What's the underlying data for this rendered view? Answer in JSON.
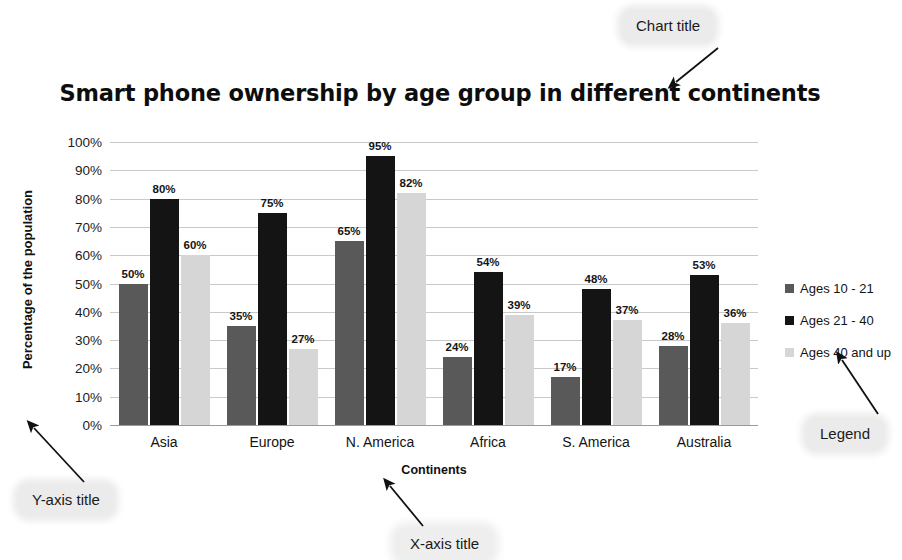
{
  "chart_data": {
    "type": "bar",
    "title": "Smart phone ownership by age group in different continents",
    "xlabel": "Continents",
    "ylabel": "Percentage of the population",
    "categories": [
      "Asia",
      "Europe",
      "N. America",
      "Africa",
      "S. America",
      "Australia"
    ],
    "series": [
      {
        "name": "Ages 10 - 21",
        "color": "#595959",
        "values": [
          50,
          35,
          65,
          24,
          17,
          28
        ],
        "labels": [
          "50%",
          "35%",
          "65%",
          "24%",
          "17%",
          "28%"
        ]
      },
      {
        "name": "Ages 21 - 40",
        "color": "#141414",
        "values": [
          80,
          75,
          95,
          54,
          48,
          53
        ],
        "labels": [
          "80%",
          "75%",
          "95%",
          "54%",
          "48%",
          "53%"
        ]
      },
      {
        "name": "Ages 40 and up",
        "color": "#d6d6d6",
        "values": [
          60,
          27,
          82,
          39,
          37,
          36
        ],
        "labels": [
          "60%",
          "27%",
          "82%",
          "39%",
          "37%",
          "36%"
        ]
      }
    ],
    "ylim": [
      0,
      100
    ],
    "ytick_labels": [
      "100%",
      "90%",
      "80%",
      "70%",
      "60%",
      "50%",
      "40%",
      "30%",
      "20%",
      "10%",
      "0%"
    ],
    "ytick_values": [
      100,
      90,
      80,
      70,
      60,
      50,
      40,
      30,
      20,
      10,
      0
    ],
    "grid": true,
    "legend_position": "right",
    "unit_suffix": "%"
  },
  "annotations": {
    "chart_title": "Chart title",
    "y_axis_title": "Y-axis title",
    "x_axis_title": "X-axis title",
    "legend": "Legend"
  }
}
